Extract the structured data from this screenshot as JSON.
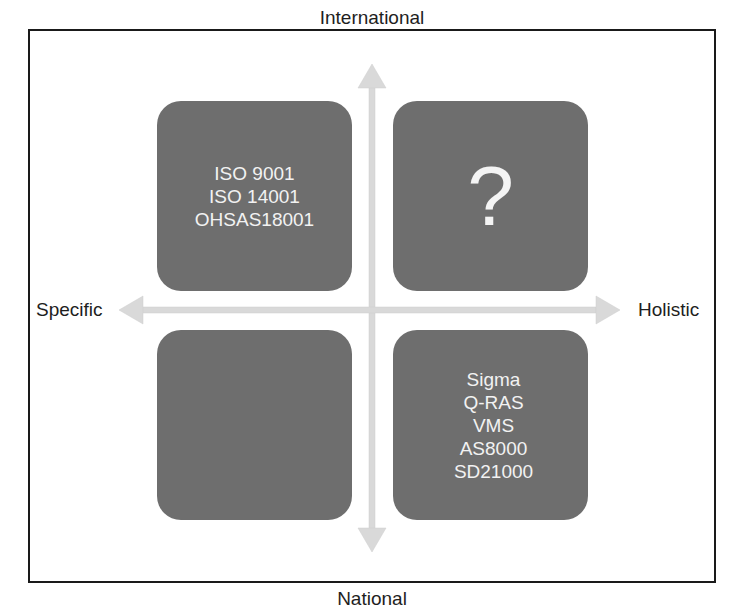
{
  "diagram": {
    "type": "quadrant-matrix",
    "axes": {
      "top": "International",
      "bottom": "National",
      "left": "Specific",
      "right": "Holistic"
    },
    "quadrants": {
      "top_left": {
        "lines": [
          "ISO 9001",
          "ISO 14001",
          "OHSAS18001"
        ]
      },
      "top_right": {
        "mark": "?"
      },
      "bottom_left": {
        "lines": []
      },
      "bottom_right": {
        "lines": [
          "Sigma",
          "Q-RAS",
          "VMS",
          "AS8000",
          "SD21000"
        ]
      }
    },
    "colors": {
      "box_fill": "#6e6e6e",
      "box_text": "#f2f2f2",
      "arrow": "#d8d8d8",
      "frame": "#1a1a1a",
      "label_text": "#1e1e1e"
    }
  }
}
